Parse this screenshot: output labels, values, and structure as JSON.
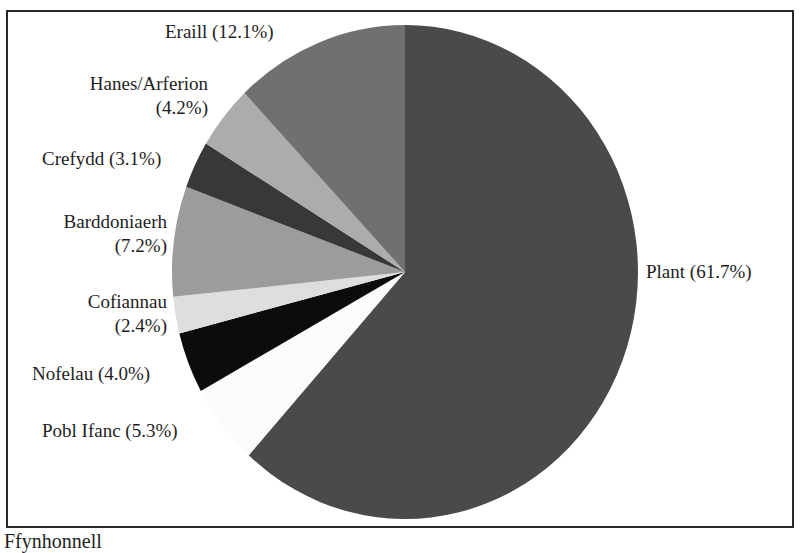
{
  "chart_data": {
    "type": "pie",
    "title": "",
    "start_angle_deg": 0,
    "direction": "clockwise",
    "categories": [
      "Plant",
      "Pobl Ifanc",
      "Nofelau",
      "Cofiannau",
      "Barddoniaerh",
      "Crefydd",
      "Hanes/Arferion",
      "Eraill"
    ],
    "values": [
      61.7,
      5.3,
      4.0,
      2.4,
      7.2,
      3.1,
      4.2,
      12.1
    ],
    "colors": [
      "#4a4a4a",
      "#fbfbfb",
      "#0c0c0c",
      "#dedede",
      "#9c9c9c",
      "#383838",
      "#acacac",
      "#707070"
    ],
    "labels": [
      {
        "text": "Plant (61.7%)"
      },
      {
        "text": "Pobl Ifanc (5.3%)"
      },
      {
        "text": "Nofelau (4.0%)"
      },
      {
        "line1": "Cofiannau",
        "line2": "(2.4%)"
      },
      {
        "line1": "Barddoniaerh",
        "line2": "(7.2%)"
      },
      {
        "text": "Crefydd (3.1%)"
      },
      {
        "line1": "Hanes/Arferion",
        "line2": "(4.2%)"
      },
      {
        "text": "Eraill (12.1%)"
      }
    ],
    "legend": "none",
    "unit": "%"
  },
  "caption": {
    "text": "Ffynhonnell"
  }
}
